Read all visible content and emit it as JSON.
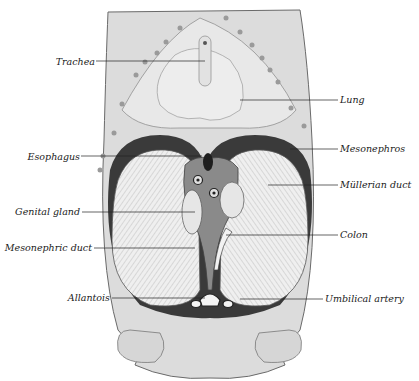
{
  "figure": {
    "colors": {
      "background": "#ffffff",
      "body_fill": "#dcdcdc",
      "body_stroke": "#6a6a6a",
      "cavity_dark": "#3a3a3a",
      "mesonephros_fill": "#ececec",
      "leader_line": "#222222",
      "label_text": "#1a1a1a"
    },
    "labels_left": [
      {
        "id": "trachea",
        "text": "Trachea",
        "x": 56,
        "y": 56,
        "line_to_x": 205,
        "line_y": 61
      },
      {
        "id": "esophagus",
        "text": "Esophagus",
        "x": 28,
        "y": 151,
        "line_to_x": 202,
        "line_y": 156
      },
      {
        "id": "genital-gland",
        "text": "Genital gland",
        "x": 16,
        "y": 205,
        "line_to_x": 195,
        "line_y": 212
      },
      {
        "id": "mesonephric-duct",
        "text": "Mesonephric duct",
        "x": 10,
        "y": 240,
        "line_to_x": 195,
        "line_y": 248
      },
      {
        "id": "allantois",
        "text": "Allantois",
        "x": 68,
        "y": 292,
        "line_to_x": 205,
        "line_y": 298
      }
    ],
    "labels_right": [
      {
        "id": "lung",
        "text": "Lung",
        "x": 340,
        "y": 95,
        "line_from_x": 240,
        "line_y": 100
      },
      {
        "id": "mesonephros",
        "text": "Mesonephros",
        "x": 340,
        "y": 142,
        "line_from_x": 290,
        "line_y": 149
      },
      {
        "id": "mullerian-duct",
        "text": "Müllerian duct",
        "x": 340,
        "y": 178,
        "line_from_x": 268,
        "line_y": 185
      },
      {
        "id": "colon",
        "text": "Colon",
        "x": 340,
        "y": 230,
        "line_from_x": 226,
        "line_y": 235
      },
      {
        "id": "umbilical-artery",
        "text": "Umbilical artery",
        "x": 325,
        "y": 294,
        "line_from_x": 240,
        "line_y": 299
      }
    ]
  }
}
